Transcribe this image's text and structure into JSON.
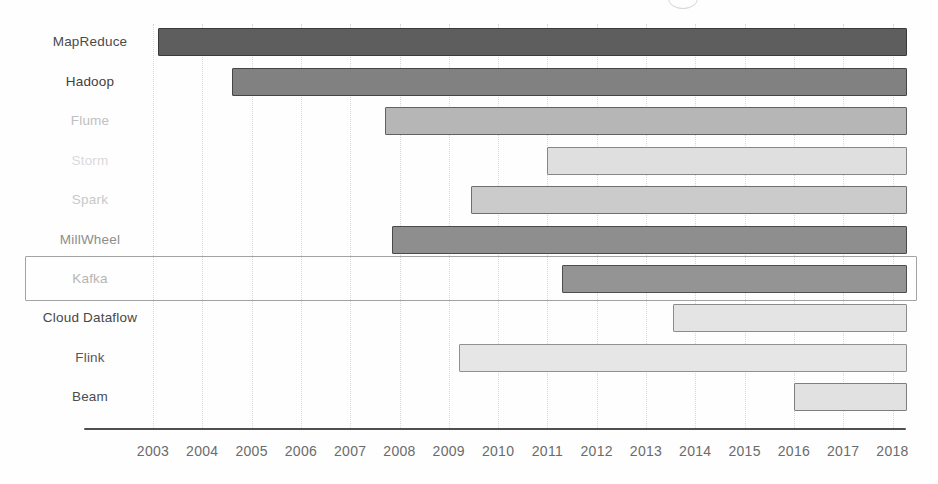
{
  "chart_data": {
    "type": "bar",
    "variant": "gantt-timeline",
    "title": "",
    "rows": [
      {
        "label": "MapReduce",
        "start": 2003.1,
        "end": 2018.3,
        "bar_fill": "#5e5e5e",
        "bar_border": "#3a3a3a",
        "label_color": "#4a4a4a",
        "highlighted": false
      },
      {
        "label": "Hadoop",
        "start": 2004.6,
        "end": 2018.3,
        "bar_fill": "#818181",
        "bar_border": "#454545",
        "label_color": "#3f3f3f",
        "highlighted": false
      },
      {
        "label": "Flume",
        "start": 2007.7,
        "end": 2018.3,
        "bar_fill": "#b6b6b6",
        "bar_border": "#616161",
        "label_color": "#c0c0c0",
        "highlighted": false
      },
      {
        "label": "Storm",
        "start": 2011.0,
        "end": 2018.3,
        "bar_fill": "#dfdfdf",
        "bar_border": "#868686",
        "label_color": "#dadada",
        "highlighted": false
      },
      {
        "label": "Spark",
        "start": 2009.45,
        "end": 2018.3,
        "bar_fill": "#cbcbcb",
        "bar_border": "#6f6f6f",
        "label_color": "#c8c8c8",
        "highlighted": false
      },
      {
        "label": "MillWheel",
        "start": 2007.85,
        "end": 2018.3,
        "bar_fill": "#8e8e8e",
        "bar_border": "#4a4a4a",
        "label_color": "#8d8d8d",
        "highlighted": false
      },
      {
        "label": "Kafka",
        "start": 2011.3,
        "end": 2018.3,
        "bar_fill": "#949494",
        "bar_border": "#4e4e4e",
        "label_color": "#b5b5b5",
        "highlighted": true
      },
      {
        "label": "Cloud Dataflow",
        "start": 2013.55,
        "end": 2018.3,
        "bar_fill": "#e4e4e4",
        "bar_border": "#8c8c8c",
        "label_color": "#474747",
        "highlighted": false
      },
      {
        "label": "Flink",
        "start": 2009.2,
        "end": 2018.3,
        "bar_fill": "#e6e6e6",
        "bar_border": "#909090",
        "label_color": "#575757",
        "highlighted": false
      },
      {
        "label": "Beam",
        "start": 2016.0,
        "end": 2018.3,
        "bar_fill": "#e1e1e1",
        "bar_border": "#7e7e7e",
        "label_color": "#4c4c4c",
        "highlighted": false
      }
    ],
    "x_ticks": [
      "2003",
      "2004",
      "2005",
      "2006",
      "2007",
      "2008",
      "2009",
      "2010",
      "2011",
      "2012",
      "2013",
      "2014",
      "2015",
      "2016",
      "2017",
      "2018"
    ],
    "xlim": [
      2001.6,
      2018.3
    ],
    "grid": "vertical-dotted",
    "legend": "none",
    "colors": {
      "axis": "#4f4f4f",
      "tick_label": "#6b6b6b",
      "gridline": "#d7d7d7",
      "highlight_box": "#a3a3a3"
    }
  }
}
